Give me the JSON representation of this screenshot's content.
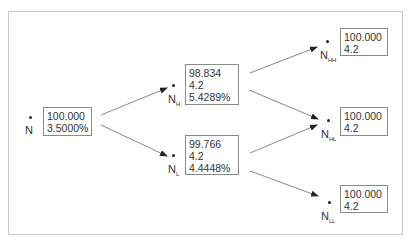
{
  "diagram": {
    "type": "binomial-tree",
    "nodes": {
      "N": {
        "label": "N",
        "sub": "",
        "values": [
          "100.000",
          "3.5000%"
        ]
      },
      "NH": {
        "label": "N",
        "sub": "H",
        "values": [
          "98.834",
          "4.2",
          "5.4289%"
        ]
      },
      "NL": {
        "label": "N",
        "sub": "L",
        "values": [
          "99.766",
          "4.2",
          "4.4448%"
        ]
      },
      "NHH": {
        "label": "N",
        "sub": "HH",
        "values": [
          "100.000",
          "4.2"
        ]
      },
      "NHL": {
        "label": "N",
        "sub": "HL",
        "values": [
          "100.000",
          "4.2"
        ]
      },
      "NLL": {
        "label": "N",
        "sub": "LL",
        "values": [
          "100.000",
          "4.2"
        ]
      }
    },
    "edges": [
      {
        "from": "N",
        "to": "NH"
      },
      {
        "from": "N",
        "to": "NL"
      },
      {
        "from": "NH",
        "to": "NHH"
      },
      {
        "from": "NH",
        "to": "NHL"
      },
      {
        "from": "NL",
        "to": "NHL"
      },
      {
        "from": "NL",
        "to": "NLL"
      }
    ],
    "colors": {
      "arrow": "#7a7a7a",
      "box_border": "#8a8a8a",
      "frame": "#c8c8c8"
    }
  }
}
